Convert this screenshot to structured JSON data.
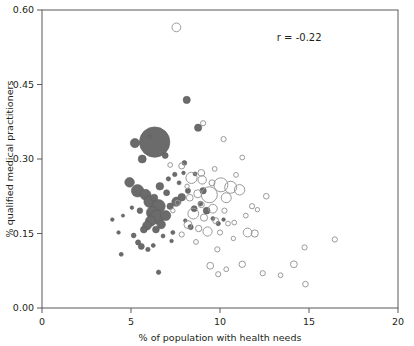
{
  "chart_data": {
    "type": "scatter",
    "title": "",
    "xlabel": "% of population with health needs",
    "ylabel": "% qualified medical practitioners",
    "xlim": [
      0,
      20
    ],
    "ylim": [
      0,
      0.6
    ],
    "xticks": [
      0,
      5,
      10,
      15,
      20
    ],
    "yticks": [
      0.0,
      0.15,
      0.3,
      0.45,
      0.6
    ],
    "xticklabels": [
      "0",
      "5",
      "10",
      "15",
      "20"
    ],
    "yticklabels": [
      "0.00",
      "0.15",
      "0.30",
      "0.45",
      "0.60"
    ],
    "grid": false,
    "legend": null,
    "annotations": [
      {
        "text": "r = -0.22",
        "x": 14.45,
        "y": 0.537
      }
    ],
    "marker_styles": {
      "filled": {
        "fill": "#6b6b6b",
        "stroke": "#5d5d5d",
        "note": "solid grey bubbles"
      },
      "open": {
        "fill": "none",
        "stroke": "#9a9a9a",
        "note": "hollow bubbles"
      }
    },
    "size_encoding": "bubble area proportional to population size",
    "series": [
      {
        "name": "filled",
        "style": "filled",
        "points": [
          {
            "x": 6.33,
            "y": 0.334,
            "s": 15.2
          },
          {
            "x": 5.22,
            "y": 0.332,
            "s": 4.6
          },
          {
            "x": 6.05,
            "y": 0.345,
            "s": 1.8
          },
          {
            "x": 5.63,
            "y": 0.3,
            "s": 4.0
          },
          {
            "x": 8.13,
            "y": 0.419,
            "s": 3.6
          },
          {
            "x": 8.77,
            "y": 0.363,
            "s": 3.6
          },
          {
            "x": 6.92,
            "y": 0.307,
            "s": 3.0
          },
          {
            "x": 8.0,
            "y": 0.292,
            "s": 2.4
          },
          {
            "x": 7.46,
            "y": 0.269,
            "s": 2.2
          },
          {
            "x": 4.92,
            "y": 0.253,
            "s": 4.8
          },
          {
            "x": 5.37,
            "y": 0.236,
            "s": 6.2
          },
          {
            "x": 5.82,
            "y": 0.228,
            "s": 5.4
          },
          {
            "x": 6.05,
            "y": 0.214,
            "s": 5.8
          },
          {
            "x": 6.3,
            "y": 0.222,
            "s": 3.6
          },
          {
            "x": 6.55,
            "y": 0.205,
            "s": 6.6
          },
          {
            "x": 6.2,
            "y": 0.192,
            "s": 6.0
          },
          {
            "x": 6.45,
            "y": 0.183,
            "s": 7.0
          },
          {
            "x": 6.1,
            "y": 0.175,
            "s": 5.2
          },
          {
            "x": 5.9,
            "y": 0.166,
            "s": 4.4
          },
          {
            "x": 5.72,
            "y": 0.158,
            "s": 3.4
          },
          {
            "x": 6.7,
            "y": 0.168,
            "s": 4.2
          },
          {
            "x": 6.95,
            "y": 0.186,
            "s": 5.0
          },
          {
            "x": 7.2,
            "y": 0.205,
            "s": 3.2
          },
          {
            "x": 7.55,
            "y": 0.214,
            "s": 4.6
          },
          {
            "x": 7.85,
            "y": 0.223,
            "s": 3.8
          },
          {
            "x": 8.2,
            "y": 0.236,
            "s": 2.6
          },
          {
            "x": 8.55,
            "y": 0.2,
            "s": 3.0
          },
          {
            "x": 8.9,
            "y": 0.21,
            "s": 2.4
          },
          {
            "x": 9.25,
            "y": 0.196,
            "s": 3.4
          },
          {
            "x": 9.6,
            "y": 0.18,
            "s": 2.0
          },
          {
            "x": 7.1,
            "y": 0.26,
            "s": 2.2
          },
          {
            "x": 7.7,
            "y": 0.252,
            "s": 2.0
          },
          {
            "x": 5.05,
            "y": 0.202,
            "s": 1.8
          },
          {
            "x": 4.55,
            "y": 0.186,
            "s": 1.6
          },
          {
            "x": 3.95,
            "y": 0.178,
            "s": 1.8
          },
          {
            "x": 4.3,
            "y": 0.152,
            "s": 1.8
          },
          {
            "x": 4.45,
            "y": 0.108,
            "s": 2.0
          },
          {
            "x": 5.4,
            "y": 0.132,
            "s": 2.6
          },
          {
            "x": 5.58,
            "y": 0.124,
            "s": 3.0
          },
          {
            "x": 5.95,
            "y": 0.118,
            "s": 2.2
          },
          {
            "x": 6.25,
            "y": 0.126,
            "s": 2.0
          },
          {
            "x": 6.55,
            "y": 0.072,
            "s": 2.2
          },
          {
            "x": 5.15,
            "y": 0.146,
            "s": 2.4
          },
          {
            "x": 6.8,
            "y": 0.145,
            "s": 2.0
          },
          {
            "x": 7.35,
            "y": 0.152,
            "s": 2.0
          },
          {
            "x": 8.35,
            "y": 0.163,
            "s": 2.6
          },
          {
            "x": 8.05,
            "y": 0.176,
            "s": 1.8
          },
          {
            "x": 9.05,
            "y": 0.236,
            "s": 3.2
          },
          {
            "x": 7.95,
            "y": 0.272,
            "s": 1.8
          },
          {
            "x": 6.62,
            "y": 0.245,
            "s": 3.8
          },
          {
            "x": 7.0,
            "y": 0.232,
            "s": 3.0
          },
          {
            "x": 5.5,
            "y": 0.196,
            "s": 2.8
          },
          {
            "x": 8.6,
            "y": 0.27,
            "s": 2.0
          },
          {
            "x": 6.4,
            "y": 0.158,
            "s": 3.4
          },
          {
            "x": 9.9,
            "y": 0.17,
            "s": 2.2
          },
          {
            "x": 10.2,
            "y": 0.178,
            "s": 1.8
          },
          {
            "x": 7.28,
            "y": 0.135,
            "s": 1.8
          }
        ]
      },
      {
        "name": "open",
        "style": "open",
        "points": [
          {
            "x": 7.55,
            "y": 0.565,
            "s": 4.4
          },
          {
            "x": 9.05,
            "y": 0.372,
            "s": 2.6
          },
          {
            "x": 10.2,
            "y": 0.34,
            "s": 2.6
          },
          {
            "x": 7.85,
            "y": 0.286,
            "s": 3.0
          },
          {
            "x": 11.25,
            "y": 0.303,
            "s": 2.4
          },
          {
            "x": 8.4,
            "y": 0.262,
            "s": 5.6
          },
          {
            "x": 9.0,
            "y": 0.258,
            "s": 4.2
          },
          {
            "x": 9.55,
            "y": 0.252,
            "s": 3.0
          },
          {
            "x": 10.05,
            "y": 0.248,
            "s": 7.0
          },
          {
            "x": 10.6,
            "y": 0.243,
            "s": 6.0
          },
          {
            "x": 11.1,
            "y": 0.238,
            "s": 5.2
          },
          {
            "x": 9.4,
            "y": 0.228,
            "s": 8.0
          },
          {
            "x": 10.35,
            "y": 0.222,
            "s": 5.0
          },
          {
            "x": 8.75,
            "y": 0.23,
            "s": 4.0
          },
          {
            "x": 8.3,
            "y": 0.222,
            "s": 3.4
          },
          {
            "x": 8.95,
            "y": 0.208,
            "s": 3.0
          },
          {
            "x": 9.6,
            "y": 0.2,
            "s": 4.4
          },
          {
            "x": 10.25,
            "y": 0.196,
            "s": 2.6
          },
          {
            "x": 11.8,
            "y": 0.205,
            "s": 2.6
          },
          {
            "x": 8.5,
            "y": 0.19,
            "s": 5.4
          },
          {
            "x": 9.1,
            "y": 0.182,
            "s": 3.6
          },
          {
            "x": 9.75,
            "y": 0.176,
            "s": 3.0
          },
          {
            "x": 10.45,
            "y": 0.17,
            "s": 2.4
          },
          {
            "x": 8.2,
            "y": 0.168,
            "s": 4.0
          },
          {
            "x": 8.8,
            "y": 0.16,
            "s": 3.2
          },
          {
            "x": 9.3,
            "y": 0.154,
            "s": 4.6
          },
          {
            "x": 10.0,
            "y": 0.152,
            "s": 2.6
          },
          {
            "x": 11.55,
            "y": 0.152,
            "s": 4.4
          },
          {
            "x": 11.95,
            "y": 0.15,
            "s": 3.6
          },
          {
            "x": 12.6,
            "y": 0.225,
            "s": 2.8
          },
          {
            "x": 10.8,
            "y": 0.172,
            "s": 2.4
          },
          {
            "x": 7.85,
            "y": 0.148,
            "s": 2.6
          },
          {
            "x": 8.65,
            "y": 0.133,
            "s": 2.4
          },
          {
            "x": 9.85,
            "y": 0.118,
            "s": 2.6
          },
          {
            "x": 10.75,
            "y": 0.14,
            "s": 2.2
          },
          {
            "x": 7.2,
            "y": 0.288,
            "s": 2.4
          },
          {
            "x": 9.45,
            "y": 0.085,
            "s": 3.4
          },
          {
            "x": 10.35,
            "y": 0.078,
            "s": 2.4
          },
          {
            "x": 11.25,
            "y": 0.088,
            "s": 3.2
          },
          {
            "x": 9.9,
            "y": 0.068,
            "s": 2.6
          },
          {
            "x": 12.4,
            "y": 0.07,
            "s": 2.6
          },
          {
            "x": 13.4,
            "y": 0.066,
            "s": 2.4
          },
          {
            "x": 14.15,
            "y": 0.088,
            "s": 3.4
          },
          {
            "x": 14.75,
            "y": 0.122,
            "s": 2.6
          },
          {
            "x": 14.8,
            "y": 0.048,
            "s": 2.8
          },
          {
            "x": 16.45,
            "y": 0.138,
            "s": 2.6
          },
          {
            "x": 8.95,
            "y": 0.272,
            "s": 3.4
          },
          {
            "x": 9.7,
            "y": 0.28,
            "s": 2.4
          },
          {
            "x": 10.9,
            "y": 0.268,
            "s": 2.4
          },
          {
            "x": 8.15,
            "y": 0.245,
            "s": 2.2
          },
          {
            "x": 11.45,
            "y": 0.186,
            "s": 2.4
          },
          {
            "x": 12.1,
            "y": 0.198,
            "s": 2.2
          },
          {
            "x": 7.62,
            "y": 0.212,
            "s": 2.6
          },
          {
            "x": 7.35,
            "y": 0.196,
            "s": 2.2
          }
        ]
      }
    ]
  }
}
